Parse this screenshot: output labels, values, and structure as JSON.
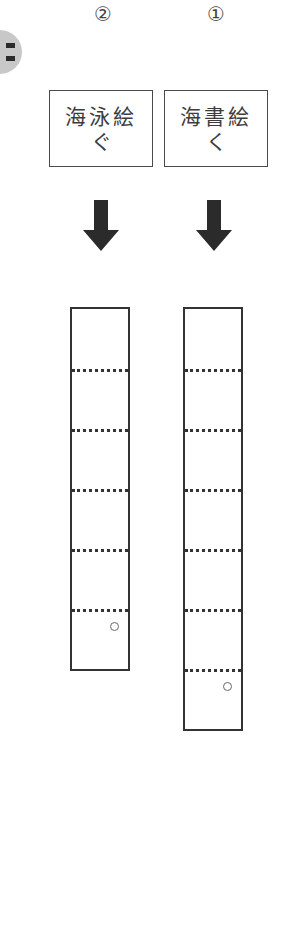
{
  "side_badge": {
    "icon": "partial-circle-badge",
    "color": "#c8c8c8"
  },
  "exercises": [
    {
      "number": "②",
      "word_line1": "海泳絵",
      "word_line2": "ぐ",
      "arrow_icon": "down-arrow",
      "cells": 6,
      "marker": "○"
    },
    {
      "number": "①",
      "word_line1": "海書絵",
      "word_line2": "く",
      "arrow_icon": "down-arrow",
      "cells": 7,
      "marker": "○"
    }
  ]
}
